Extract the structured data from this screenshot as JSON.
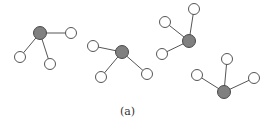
{
  "caption": "(a)",
  "colors": {
    "edge": "#555555",
    "center_fill": "#808080",
    "center_stroke": "#4a4a4a",
    "leaf_fill": "#ffffff",
    "leaf_stroke": "#555555"
  },
  "node_radius": {
    "center": 6.5,
    "leaf": 5.5
  },
  "graphs": [
    {
      "center": [
        40,
        33
      ],
      "leaves": [
        [
          71,
          33
        ],
        [
          20,
          57
        ],
        [
          50,
          64
        ]
      ]
    },
    {
      "center": [
        122,
        52
      ],
      "leaves": [
        [
          93,
          46
        ],
        [
          101,
          77
        ],
        [
          147,
          74
        ]
      ]
    },
    {
      "center": [
        189,
        41
      ],
      "leaves": [
        [
          194,
          9
        ],
        [
          165,
          22
        ],
        [
          162,
          54
        ]
      ]
    },
    {
      "center": [
        224,
        92
      ],
      "leaves": [
        [
          227,
          59
        ],
        [
          197,
          75
        ],
        [
          254,
          78
        ]
      ]
    }
  ]
}
